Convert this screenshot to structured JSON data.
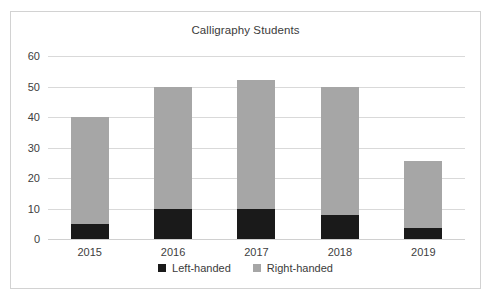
{
  "chart_data": {
    "type": "bar",
    "subtype": "stacked-column",
    "title": "Calligraphy Students",
    "xlabel": "",
    "ylabel": "",
    "categories": [
      "2015",
      "2016",
      "2017",
      "2018",
      "2019"
    ],
    "series": [
      {
        "name": "Left-handed",
        "color": "#1a1a1a",
        "values": [
          5,
          10,
          10,
          8,
          3.5
        ]
      },
      {
        "name": "Right-handed",
        "color": "#a6a6a6",
        "values": [
          35,
          40,
          42,
          42,
          22
        ]
      }
    ],
    "totals": [
      40,
      50,
      52,
      50,
      25.5
    ],
    "ylim": [
      0,
      60
    ],
    "yticks": [
      60,
      50,
      40,
      30,
      20,
      10,
      0
    ],
    "grid": true,
    "legend_position": "bottom"
  },
  "legend": {
    "items": [
      {
        "label": "Left-handed",
        "color": "#1a1a1a"
      },
      {
        "label": "Right-handed",
        "color": "#a6a6a6"
      }
    ]
  },
  "colors": {
    "left_handed": "#1a1a1a",
    "right_handed": "#a6a6a6",
    "gridline": "#d9d9d9",
    "border": "#d2d2d2",
    "background": "#ffffff",
    "text": "#404040"
  }
}
